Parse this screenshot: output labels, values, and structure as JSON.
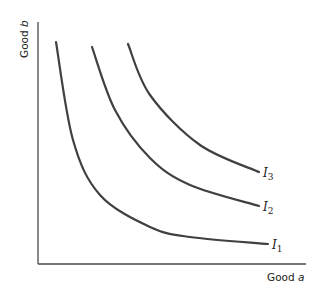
{
  "chart_data": {
    "type": "line",
    "title": "",
    "xlabel": "Good a",
    "ylabel": "Good b",
    "xlabel_parts": {
      "text": "Good ",
      "var": "a"
    },
    "ylabel_parts": {
      "text": "Good ",
      "var": "b"
    },
    "grid": false,
    "ticks": false,
    "legend": "inline labels at curve ends",
    "series": [
      {
        "name": "I1",
        "label_main": "I",
        "label_sub": "1",
        "points_px": [
          [
            56,
            42
          ],
          [
            73,
            140
          ],
          [
            100,
            195
          ],
          [
            150,
            227
          ],
          [
            190,
            237
          ],
          [
            268,
            244
          ]
        ]
      },
      {
        "name": "I2",
        "label_main": "I",
        "label_sub": "2",
        "points_px": [
          [
            92,
            47
          ],
          [
            115,
            110
          ],
          [
            150,
            158
          ],
          [
            190,
            185
          ],
          [
            259,
            206
          ]
        ]
      },
      {
        "name": "I3",
        "label_main": "I",
        "label_sub": "3",
        "points_px": [
          [
            128,
            44
          ],
          [
            150,
            95
          ],
          [
            200,
            145
          ],
          [
            259,
            172
          ]
        ]
      }
    ]
  }
}
